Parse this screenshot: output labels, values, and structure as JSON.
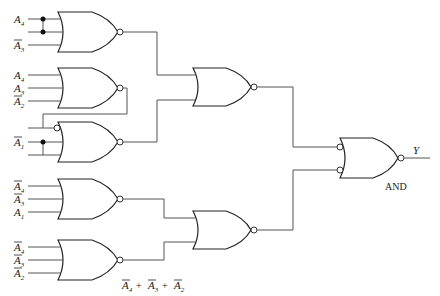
{
  "diagram": {
    "type": "logic-circuit",
    "gates": [
      {
        "id": "g1",
        "kind": "NOR",
        "inputs": [
          "A4",
          "A4",
          "NOT A3"
        ]
      },
      {
        "id": "g2",
        "kind": "NOR",
        "inputs": [
          "A4",
          "A3",
          "NOT A2"
        ]
      },
      {
        "id": "g3",
        "kind": "NOR",
        "inputs": [
          "NOT g2 (bubbled)",
          "NOT A1",
          "NOT A1"
        ]
      },
      {
        "id": "g4",
        "kind": "NOR",
        "inputs": [
          "NOT A4",
          "NOT A3",
          "A1"
        ]
      },
      {
        "id": "g5",
        "kind": "NOR",
        "inputs": [
          "NOT A4",
          "NOT A3",
          "NOT A2"
        ]
      },
      {
        "id": "g6",
        "kind": "NOR",
        "inputs": [
          "g1",
          "g3"
        ]
      },
      {
        "id": "g7",
        "kind": "NOR",
        "inputs": [
          "g4",
          "g5"
        ]
      },
      {
        "id": "g8",
        "kind": "AND (negative-input)",
        "inputs": [
          "g6",
          "g7"
        ],
        "output": "Y"
      }
    ],
    "labels": {
      "g1": [
        {
          "var": "A",
          "sub": "4",
          "bar": false
        },
        {
          "var": "A",
          "sub": "3",
          "bar": true
        }
      ],
      "g2": [
        {
          "var": "A",
          "sub": "4",
          "bar": false
        },
        {
          "var": "A",
          "sub": "3",
          "bar": false
        },
        {
          "var": "A",
          "sub": "2",
          "bar": true
        }
      ],
      "g3": [
        {
          "var": "A",
          "sub": "1",
          "bar": true
        }
      ],
      "g4": [
        {
          "var": "A",
          "sub": "4",
          "bar": true
        },
        {
          "var": "A",
          "sub": "3",
          "bar": true
        },
        {
          "var": "A",
          "sub": "1",
          "bar": false
        }
      ],
      "g5": [
        {
          "var": "A",
          "sub": "4",
          "bar": true
        },
        {
          "var": "A",
          "sub": "3",
          "bar": true
        },
        {
          "var": "A",
          "sub": "2",
          "bar": true
        }
      ]
    },
    "expression_label": "Ā4 + Ā3 + Ā2",
    "output_label": "Y",
    "final_gate_caption": "AND"
  }
}
